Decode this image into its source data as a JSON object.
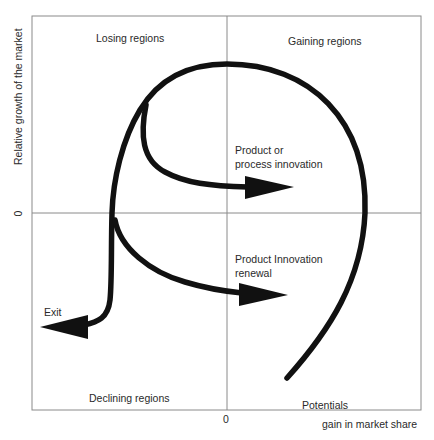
{
  "diagram": {
    "quadrants": {
      "top_left": "Losing regions",
      "top_right": "Gaining regions",
      "bottom_left": "Declining regions",
      "bottom_right": "Potentials"
    },
    "axes": {
      "y_label": "Relative growth of the market",
      "x_label": "gain in market share",
      "y_zero": "0",
      "x_zero": "0"
    },
    "paths": {
      "upper_branch": "Product or process innovation",
      "upper_branch_line1": "Product or",
      "upper_branch_line2": "process innovation",
      "lower_branch_line1": "Product Innovation",
      "lower_branch_line2": "renewal",
      "exit": "Exit"
    },
    "colors": {
      "stroke": "#111111",
      "frame": "#8a8a8a",
      "text": "#2a2a2a",
      "background": "#ffffff"
    }
  }
}
